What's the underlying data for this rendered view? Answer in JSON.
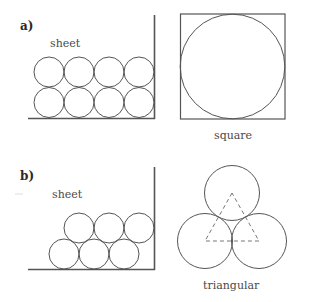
{
  "panels": {
    "a": {
      "label": "a)",
      "sheet_label": "sheet",
      "packing_label": "square"
    },
    "b": {
      "label": "b)",
      "sheet_label": "sheet",
      "packing_label": "triangular"
    }
  },
  "colors": {
    "line": "#555555",
    "dashed_triangle": "#777777",
    "text": "#4a4a4a",
    "background": "#ffffff"
  }
}
